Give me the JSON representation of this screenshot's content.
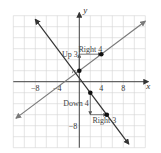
{
  "chart_data": {
    "type": "line",
    "title": "",
    "xlabel": "x",
    "ylabel": "y",
    "xlim": [
      -12,
      12
    ],
    "ylim": [
      -12,
      12
    ],
    "grid": true,
    "grid_step": 2,
    "x_ticks": [
      -8,
      -4,
      4,
      8
    ],
    "x_tick_labels": [
      "−8",
      "−4",
      "4",
      "8"
    ],
    "y_ticks": [
      -8
    ],
    "y_tick_labels": [
      "−8"
    ],
    "series": [
      {
        "name": "line-slope-3-4",
        "equation": "y = 3/4 x + 2",
        "slope": 0.75,
        "intercept": 2,
        "x_range": [
          -11.5,
          12
        ],
        "color": "#7a7a7a",
        "points": [
          {
            "x": 0,
            "y": 2
          },
          {
            "x": 4,
            "y": 5
          }
        ]
      },
      {
        "name": "line-slope-neg-4-3",
        "equation": "y = -4/3 x + 2/3",
        "slope": -1.3333,
        "intercept": 0.6667,
        "x_range": [
          -8,
          9
        ],
        "color": "#333333",
        "points": [
          {
            "x": 2,
            "y": -2
          },
          {
            "x": 5,
            "y": -6
          }
        ]
      }
    ],
    "annotations": [
      {
        "text": "Up 3",
        "kind": "rise",
        "from": [
          0,
          2
        ],
        "to": [
          0,
          5
        ]
      },
      {
        "text": "Right 4",
        "kind": "run",
        "from": [
          0,
          5
        ],
        "to": [
          4,
          5
        ]
      },
      {
        "text": "Down 4",
        "kind": "rise",
        "from": [
          2,
          -2
        ],
        "to": [
          2,
          -6
        ]
      },
      {
        "text": "Right 3",
        "kind": "run",
        "from": [
          2,
          -6
        ],
        "to": [
          5,
          -6
        ]
      }
    ],
    "right_angle_marker_at": [
      -0.72,
      1.46
    ]
  }
}
